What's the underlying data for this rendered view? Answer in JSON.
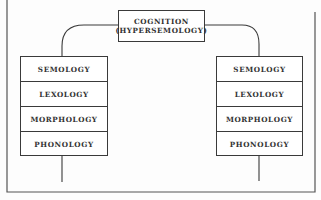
{
  "diagram": {
    "top_node": {
      "line1": "COGNITION",
      "line2": "(HYPERSEMOLOGY)"
    },
    "left_stack": {
      "rows": [
        "SEMOLOGY",
        "LEXOLOGY",
        "MORPHOLOGY",
        "PHONOLOGY"
      ]
    },
    "right_stack": {
      "rows": [
        "SEMOLOGY",
        "LEXOLOGY",
        "MORPHOLOGY",
        "PHONOLOGY"
      ]
    },
    "colors": {
      "line": "#3a3a3a",
      "background": "#fdfdfd"
    }
  }
}
